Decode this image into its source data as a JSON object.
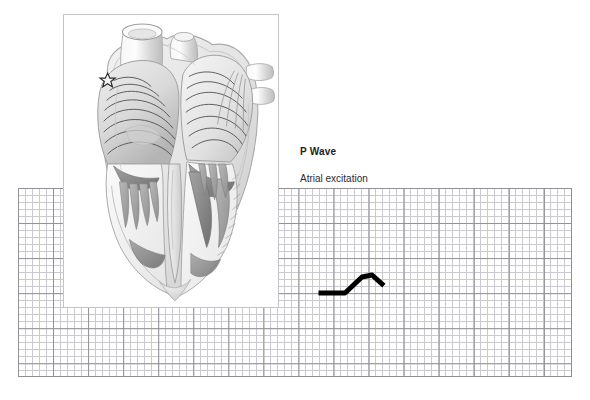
{
  "figure": {
    "kind": "cardiac-conduction-diagram",
    "title_label": "P Wave",
    "subtitle_label": "Atrial excitation",
    "background_color": "#ffffff"
  },
  "ecg_paper": {
    "name": "ecg-graph-paper",
    "minor_grid_color": "#c9c9cf",
    "major_grid_color": "#8f8f95",
    "minor_cell_px": 7,
    "major_cell_px": 35,
    "left": 18,
    "top": 188,
    "width": 554,
    "height": 189
  },
  "heart_panel": {
    "name": "heart-anatomy-panel",
    "border_color": "#c4c4c4",
    "fill_color": "#ffffff",
    "sa_node_marker": "star-icon",
    "structures": [
      "superior vena cava",
      "aorta",
      "pulmonary artery",
      "pulmonary veins",
      "right atrium",
      "left atrium",
      "right ventricle",
      "left ventricle",
      "interventricular septum",
      "papillary muscles",
      "trabeculae carneae",
      "atrial excitation wavefront"
    ],
    "shading": "grayscale pencil rendering"
  },
  "chart_data": {
    "type": "line",
    "title": "P Wave",
    "subtitle": "Atrial excitation",
    "xlabel": "",
    "ylabel": "",
    "grid": true,
    "legend": "none",
    "trace_color": "#000000",
    "trace_width_px": 5,
    "xlim": [
      0,
      120
    ],
    "ylim": [
      0,
      60
    ],
    "points": [
      {
        "x": 21,
        "y": 38
      },
      {
        "x": 45,
        "y": 38
      },
      {
        "x": 62,
        "y": 22
      },
      {
        "x": 72,
        "y": 20
      },
      {
        "x": 82,
        "y": 29
      }
    ],
    "annotations": [
      {
        "label": "baseline",
        "x": 30,
        "y": 38
      },
      {
        "label": "P wave peak",
        "x": 68,
        "y": 20
      }
    ]
  }
}
